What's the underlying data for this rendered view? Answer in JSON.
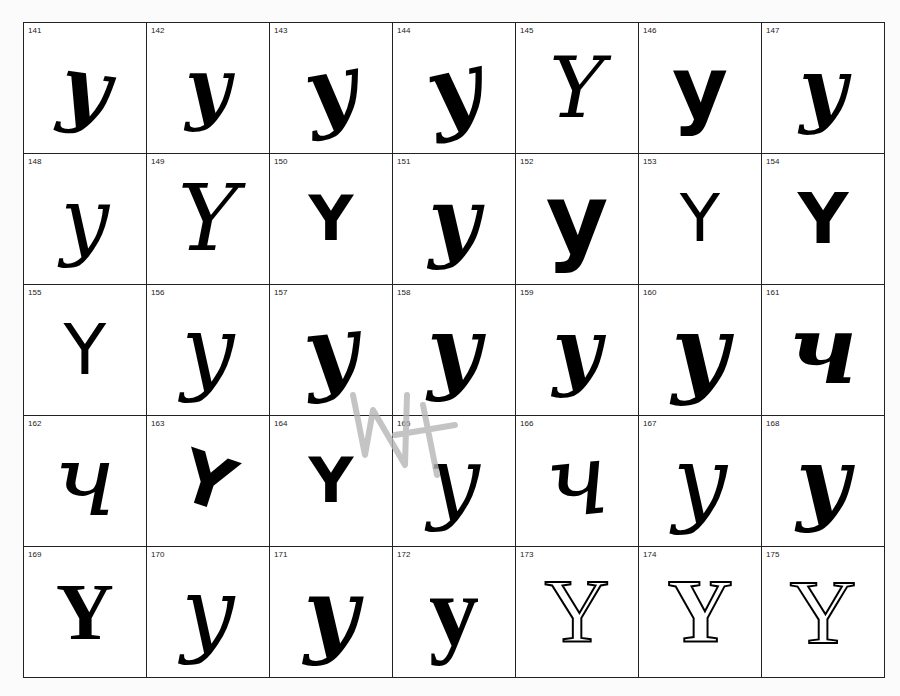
{
  "page": {
    "letter": "Y",
    "grid": {
      "columns": 7,
      "rows": 5
    }
  },
  "specimens": [
    {
      "num": "141",
      "glyph": "y",
      "style": "script",
      "weight": "bold",
      "size": 84,
      "rotate": 8
    },
    {
      "num": "142",
      "glyph": "y",
      "style": "script",
      "weight": "bold",
      "size": 78,
      "rotate": 0
    },
    {
      "num": "143",
      "glyph": "y",
      "style": "script",
      "weight": "bold",
      "size": 88,
      "rotate": -10
    },
    {
      "num": "144",
      "glyph": "y",
      "style": "script",
      "weight": "bold",
      "size": 92,
      "rotate": -12
    },
    {
      "num": "145",
      "glyph": "Y",
      "style": "script",
      "weight": "normal",
      "size": 84,
      "rotate": 0
    },
    {
      "num": "146",
      "glyph": "y",
      "style": "sans",
      "weight": "bold",
      "size": 86,
      "rotate": 0
    },
    {
      "num": "147",
      "glyph": "y",
      "style": "script",
      "weight": "bold",
      "size": 82,
      "rotate": 0
    },
    {
      "num": "148",
      "glyph": "y",
      "style": "script",
      "weight": "normal",
      "size": 86,
      "rotate": 0
    },
    {
      "num": "149",
      "glyph": "Y",
      "style": "script",
      "weight": "normal",
      "size": 92,
      "rotate": 0
    },
    {
      "num": "150",
      "glyph": "Y",
      "style": "sans",
      "weight": "bold",
      "size": 62,
      "rotate": 0
    },
    {
      "num": "151",
      "glyph": "y",
      "style": "script",
      "weight": "bold",
      "size": 88,
      "rotate": 0
    },
    {
      "num": "152",
      "glyph": "y",
      "style": "sans",
      "weight": "bold",
      "size": 96,
      "rotate": 0
    },
    {
      "num": "153",
      "glyph": "Y",
      "style": "sans",
      "weight": "normal",
      "size": 66,
      "rotate": 0
    },
    {
      "num": "154",
      "glyph": "Y",
      "style": "sans",
      "weight": "bold",
      "size": 70,
      "rotate": 0
    },
    {
      "num": "155",
      "glyph": "Y",
      "style": "sans",
      "weight": "normal",
      "size": 70,
      "rotate": 0
    },
    {
      "num": "156",
      "glyph": "y",
      "style": "script",
      "weight": "normal",
      "size": 94,
      "rotate": 0
    },
    {
      "num": "157",
      "glyph": "y",
      "style": "script",
      "weight": "bold",
      "size": 92,
      "rotate": -6
    },
    {
      "num": "158",
      "glyph": "y",
      "style": "script",
      "weight": "bold",
      "size": 92,
      "rotate": 0
    },
    {
      "num": "159",
      "glyph": "y",
      "style": "script",
      "weight": "bold",
      "size": 84,
      "rotate": 0
    },
    {
      "num": "160",
      "glyph": "y",
      "style": "script",
      "weight": "bold",
      "size": 98,
      "rotate": 0
    },
    {
      "num": "161",
      "glyph": "ч",
      "style": "script",
      "weight": "bold",
      "size": 96,
      "rotate": 0
    },
    {
      "num": "162",
      "glyph": "ч",
      "style": "script",
      "weight": "normal",
      "size": 100,
      "rotate": 0
    },
    {
      "num": "163",
      "glyph": "Y",
      "style": "sans",
      "weight": "bold",
      "size": 72,
      "rotate": 18
    },
    {
      "num": "164",
      "glyph": "Y",
      "style": "sans",
      "weight": "bold",
      "size": 62,
      "rotate": 0
    },
    {
      "num": "165",
      "glyph": "y",
      "style": "script",
      "weight": "normal",
      "size": 92,
      "rotate": 0
    },
    {
      "num": "166",
      "glyph": "ч",
      "style": "script",
      "weight": "normal",
      "size": 100,
      "rotate": -6
    },
    {
      "num": "167",
      "glyph": "y",
      "style": "script",
      "weight": "normal",
      "size": 96,
      "rotate": 0
    },
    {
      "num": "168",
      "glyph": "y",
      "style": "script",
      "weight": "bold",
      "size": 92,
      "rotate": 0
    },
    {
      "num": "169",
      "glyph": "Y",
      "style": "serif",
      "weight": "bold",
      "size": 80,
      "rotate": 0
    },
    {
      "num": "170",
      "glyph": "y",
      "style": "script",
      "weight": "normal",
      "size": 94,
      "rotate": 0
    },
    {
      "num": "171",
      "glyph": "y",
      "style": "script",
      "weight": "bold",
      "size": 94,
      "rotate": 0
    },
    {
      "num": "172",
      "glyph": "y",
      "style": "serif",
      "weight": "bold",
      "size": 100,
      "rotate": 0
    },
    {
      "num": "173",
      "glyph": "Y",
      "style": "outline",
      "weight": "normal",
      "size": 90,
      "rotate": 0
    },
    {
      "num": "174",
      "glyph": "Y",
      "style": "outline",
      "weight": "bold",
      "size": 90,
      "rotate": 0
    },
    {
      "num": "175",
      "glyph": "Y",
      "style": "outline",
      "weight": "normal",
      "size": 92,
      "rotate": 0
    }
  ],
  "annotation": {
    "type": "pencil-scribble",
    "color": "#b5b5b5"
  }
}
